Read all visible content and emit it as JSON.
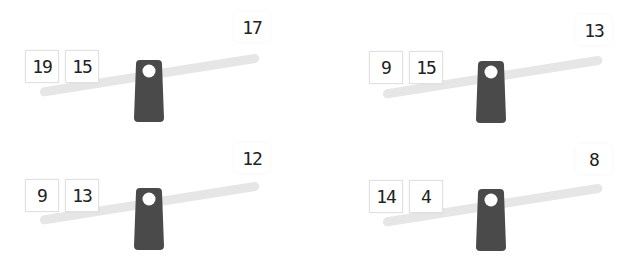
{
  "puzzles": [
    {
      "left_weights": [
        "19",
        "15"
      ],
      "right_target": "17"
    },
    {
      "left_weights": [
        "9",
        "15"
      ],
      "right_target": "13"
    },
    {
      "left_weights": [
        "9",
        "13"
      ],
      "right_target": "12"
    },
    {
      "left_weights": [
        "14",
        "4"
      ],
      "right_target": "8"
    }
  ],
  "colors": {
    "beam": "#e6e6e6",
    "fulcrum": "#4a4a4a",
    "box_border": "#e0e0e0"
  }
}
